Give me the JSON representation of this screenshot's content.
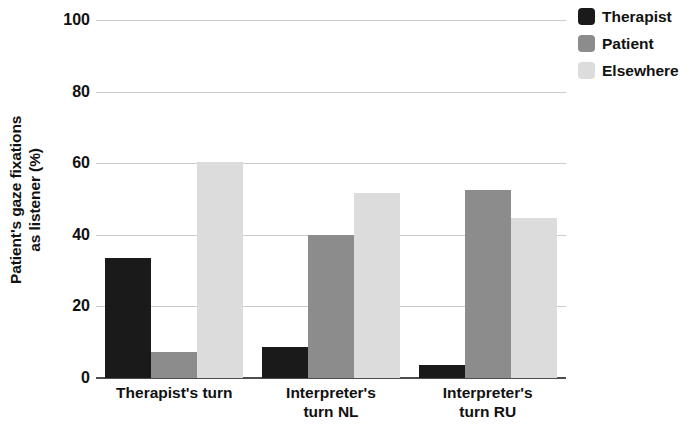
{
  "chart_data": {
    "type": "bar",
    "title": "",
    "xlabel": "",
    "ylabel_line1": "Patient's gaze fixations",
    "ylabel_line2": "as listener (%)",
    "categories": [
      "Therapist's turn",
      "Interpreter's turn NL",
      "Interpreter's turn RU"
    ],
    "category_lines": [
      [
        "Therapist's turn",
        ""
      ],
      [
        "Interpreter's",
        "turn NL"
      ],
      [
        "Interpreter's",
        "turn RU"
      ]
    ],
    "series": [
      {
        "name": "Therapist",
        "color": "#1a1a1a",
        "values": [
          33.5,
          8.6,
          3.6
        ]
      },
      {
        "name": "Patient",
        "color": "#8c8c8c",
        "values": [
          7.3,
          40.0,
          52.8
        ]
      },
      {
        "name": "Elsewhere",
        "color": "#dcdcdc",
        "values": [
          60.5,
          51.8,
          44.8
        ]
      }
    ],
    "ylim": [
      0,
      100
    ],
    "yticks": [
      0,
      20,
      40,
      60,
      80,
      100
    ],
    "ytick_labels": [
      "0",
      "20",
      "40",
      "60",
      "80",
      "100"
    ],
    "grid": true,
    "legend_position": "top-right",
    "legend_entries": [
      "Therapist",
      "Patient",
      "Elsewhere"
    ]
  }
}
